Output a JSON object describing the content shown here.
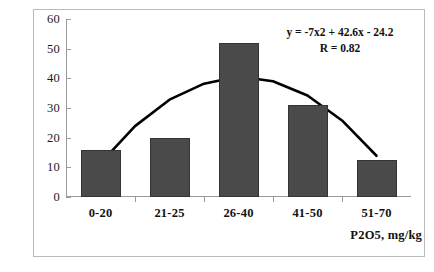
{
  "chart_data": {
    "type": "bar",
    "title": "",
    "subtitle": "",
    "xlabel": "P2O5, mg/kg",
    "ylabel": "",
    "categories": [
      "0-20",
      "21-25",
      "26-40",
      "41-50",
      "51-70"
    ],
    "values": [
      16,
      20,
      52,
      31,
      12.5
    ],
    "series": [
      {
        "name": "frequency",
        "values": [
          16,
          20,
          52,
          31,
          12.5
        ]
      },
      {
        "name": "quadratic trendline",
        "type": "line",
        "equation": "y = -7x2 + 42.6x - 24.2",
        "r": "R = 0.82",
        "points": [
          {
            "x": 1.0,
            "y": 11.4
          },
          {
            "x": 1.5,
            "y": 23.9
          },
          {
            "x": 2.0,
            "y": 32.8
          },
          {
            "x": 2.5,
            "y": 38.2
          },
          {
            "x": 3.0,
            "y": 40.6
          },
          {
            "x": 3.5,
            "y": 39.0
          },
          {
            "x": 4.0,
            "y": 34.2
          },
          {
            "x": 4.5,
            "y": 25.8
          },
          {
            "x": 5.0,
            "y": 13.9
          }
        ]
      }
    ],
    "ylim": [
      0,
      60
    ],
    "y_ticks": [
      "0",
      "10",
      "20",
      "30",
      "40",
      "50",
      "60"
    ],
    "y_tick_values": [
      0,
      10,
      20,
      30,
      40,
      50,
      60
    ],
    "grid": false,
    "legend": "none",
    "annotations": [
      "y = -7x2 + 42.6x - 24.2",
      "R = 0.82"
    ],
    "colors": {
      "bar_fill": "#4a4a4a",
      "bar_border": "#343434",
      "trendline": "#000000",
      "axis": "#9a9a9a",
      "frame": "#b9b9b9",
      "text": "#111111",
      "background": "#ffffff"
    }
  }
}
